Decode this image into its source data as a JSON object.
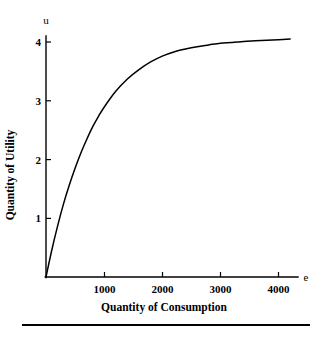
{
  "chart_data": {
    "type": "line",
    "title": "",
    "subtitle": "",
    "xlabel": "Quantity of Consumption",
    "ylabel": "Quantity of Utility",
    "x_axis_variable": "e",
    "y_axis_variable": "u",
    "xlim": [
      0,
      4400
    ],
    "ylim": [
      0,
      4.3
    ],
    "x_ticks": [
      1000,
      2000,
      3000,
      4000
    ],
    "x_tick_labels": [
      "1000",
      "2000",
      "3000",
      "4000"
    ],
    "y_ticks": [
      1,
      2,
      3,
      4
    ],
    "y_tick_labels": [
      "1",
      "2",
      "3",
      "4"
    ],
    "grid": false,
    "legend": "none",
    "series": [
      {
        "name": "utility",
        "color": "#000000",
        "x": [
          0,
          100,
          200,
          300,
          400,
          500,
          600,
          700,
          800,
          900,
          1000,
          1200,
          1400,
          1600,
          1800,
          2000,
          2200,
          2400,
          2600,
          2800,
          3000,
          3200,
          3400,
          3600,
          3800,
          4000,
          4200
        ],
        "y": [
          0,
          0.46,
          0.87,
          1.24,
          1.56,
          1.85,
          2.11,
          2.34,
          2.55,
          2.73,
          2.89,
          3.16,
          3.37,
          3.53,
          3.66,
          3.76,
          3.83,
          3.88,
          3.92,
          3.95,
          3.98,
          3.99,
          4.01,
          4.02,
          4.03,
          4.04,
          4.05
        ]
      }
    ],
    "asymptote": 4.05,
    "annotations": []
  },
  "figure": {
    "bottom_rule": "horizontal-rule"
  }
}
